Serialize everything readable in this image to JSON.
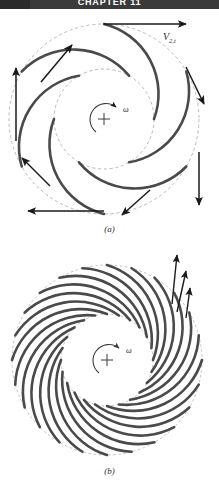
{
  "page": {
    "running_head": "CHAPTER 11",
    "background_color": "#ffffff",
    "band_color": "#3a3a3a"
  },
  "figure": {
    "blade_color": "#4a4a4a",
    "dashed_circle_color": "#a9a9a9",
    "arrow_color": "#1a1a1a",
    "panels": [
      {
        "id": "a",
        "caption": "(a)",
        "type": "centrifugal-impeller-few-blades",
        "blade_count": 6,
        "center": {
          "x": 104,
          "y": 119
        },
        "outer_radius": 95,
        "inner_radius": 50,
        "rotation_label": "ω",
        "velocity_label_text": "V",
        "velocity_label_sub": "2,t",
        "velocity_arrow_count": 6
      },
      {
        "id": "b",
        "caption": "(b)",
        "type": "centrifugal-impeller-many-blades",
        "blade_count": 24,
        "center": {
          "x": 107,
          "y": 360
        },
        "outer_radius": 95,
        "inner_radius": 46,
        "rotation_label": "ω",
        "velocity_arrow_count": 3
      }
    ]
  },
  "icons": {
    "center_mark": "plus-crosshair-icon",
    "rotation": "curved-arrow-icon",
    "velocity": "straight-arrow-icon"
  }
}
